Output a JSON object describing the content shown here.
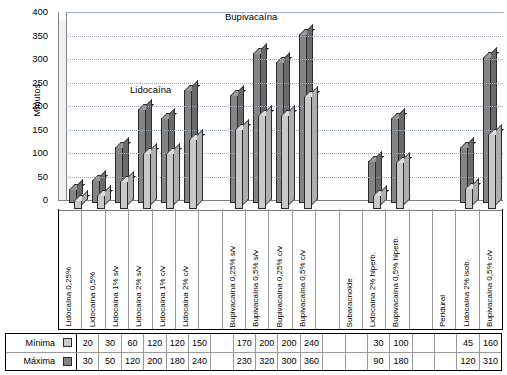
{
  "chart_data": {
    "type": "bar",
    "title": "",
    "xlabel": "",
    "ylabel": "Minutos",
    "ylim": [
      0,
      400
    ],
    "yticks": [
      0,
      50,
      100,
      150,
      200,
      250,
      300,
      350,
      400
    ],
    "grid": true,
    "legend_position": "bottom-table",
    "categories": [
      "Lidocaína 0,25%",
      "Lidocaína 0,5%",
      "Lidocaína 1% s/v",
      "Lidocaína 2% s/v",
      "Lidocaína 1% c/v",
      "Lidocaína 2% c/v",
      "",
      "Bupivacaína 0,25% s/v",
      "Bupivacaína 0,5% s/v",
      "Bupivacaína 0,25% c/v",
      "Bupivacaína 0,5% c/v",
      "",
      "Subaracnoide",
      "Lidocaína 2% hiperb.",
      "Bupivacaína 0,5% hiperb.",
      "",
      "Peridural",
      "Lidocaína 2% isob.",
      "Bupivacaína 0,5% c/v"
    ],
    "series": [
      {
        "name": "Mínima",
        "color": "#c9c9c9",
        "values": [
          20,
          30,
          60,
          120,
          120,
          150,
          null,
          170,
          200,
          200,
          240,
          null,
          null,
          30,
          100,
          null,
          null,
          45,
          160
        ]
      },
      {
        "name": "Máxima",
        "color": "#848484",
        "values": [
          30,
          50,
          120,
          200,
          180,
          240,
          null,
          230,
          320,
          300,
          360,
          null,
          null,
          90,
          180,
          null,
          null,
          120,
          310
        ]
      }
    ],
    "annotations": [
      {
        "text": "Lidocaína",
        "x_index": 3,
        "y": 260
      },
      {
        "text": "Bupivacaína",
        "x_index": 9,
        "y": 390
      }
    ]
  },
  "axis": {
    "ylabel": "Minutos",
    "ticks": [
      "400",
      "350",
      "300",
      "250",
      "200",
      "150",
      "100",
      "50",
      "0"
    ]
  },
  "annotations": {
    "lidocaina": "Lidocaína",
    "bupivacaina": "Bupivacaína"
  },
  "xlabels": [
    "Lidocaína 0,25%",
    "Lidocaína 0,5%",
    "Lidocaína 1% s/v",
    "Lidocaína 2% s/v",
    "Lidocaína 1% c/v",
    "Lidocaína 2% c/v",
    "",
    "Bupivacaína 0,25% s/v",
    "Bupivacaína 0,5% s/v",
    "Bupivacaína 0,25% c/v",
    "Bupivacaína 0,5% c/v",
    "",
    "Subaracnoide",
    "Lidocaína 2% hiperb.",
    "Bupivacaína 0,5% hiperb.",
    "",
    "Peridural",
    "Lidocaína 2% isob.",
    "Bupivacaína 0,5% c/v"
  ],
  "table": {
    "rows": [
      {
        "label": "Mínima",
        "swatch": "light",
        "values": [
          "20",
          "30",
          "60",
          "120",
          "120",
          "150",
          "",
          "170",
          "200",
          "200",
          "240",
          "",
          "",
          "30",
          "100",
          "",
          "",
          "45",
          "160"
        ]
      },
      {
        "label": "Máxima",
        "swatch": "dark",
        "values": [
          "30",
          "50",
          "120",
          "200",
          "180",
          "240",
          "",
          "230",
          "320",
          "300",
          "360",
          "",
          "",
          "90",
          "180",
          "",
          "",
          "120",
          "310"
        ]
      }
    ]
  },
  "colors": {
    "minima": "#c9c9c9",
    "maxima": "#848484",
    "grid": "#9aa6b4",
    "axis": "#808080"
  }
}
